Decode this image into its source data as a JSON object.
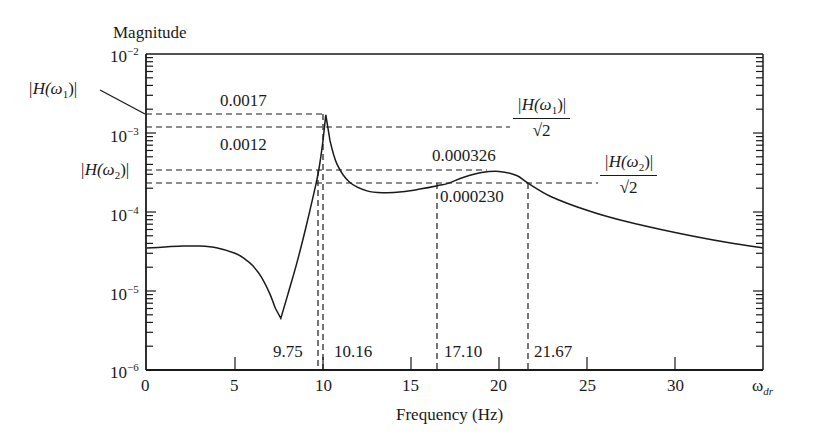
{
  "chart_data": {
    "type": "line",
    "title": "",
    "ylabel": "Magnitude",
    "xlabel": "Frequency (Hz)",
    "x_end_label": "ω_dr",
    "yscale": "log",
    "ylim": [
      1e-06,
      0.01
    ],
    "xlim": [
      0,
      35
    ],
    "grid": false,
    "x_ticks": [
      0,
      5,
      10,
      15,
      20,
      25,
      30
    ],
    "x_tick_labels": [
      "0",
      "5",
      "10",
      "15",
      "20",
      "25",
      "30"
    ],
    "y_tick_labels": [
      "10^-2",
      "10^-3",
      "10^-4",
      "10^-5",
      "10^-6"
    ],
    "series": [
      {
        "name": "|H(ω)|",
        "x": [
          0,
          1,
          2,
          3,
          4,
          5,
          5.5,
          6,
          6.5,
          7,
          7.3,
          7.6,
          8,
          8.5,
          9,
          9.5,
          9.75,
          10,
          10.16,
          10.4,
          10.8,
          11.5,
          12.5,
          13.5,
          14.5,
          15.5,
          16.5,
          17.1,
          18,
          19,
          20,
          21,
          21.67,
          23,
          25,
          27,
          30,
          33,
          35
        ],
        "y": [
          3.5e-05,
          3.6e-05,
          3.7e-05,
          3.7e-05,
          3.5e-05,
          3e-05,
          2.6e-05,
          2.1e-05,
          1.5e-05,
          9e-06,
          6e-06,
          4.5e-06,
          9e-06,
          2.2e-05,
          6e-05,
          0.00018,
          0.00033,
          0.0008,
          0.0017,
          0.0008,
          0.0004,
          0.00024,
          0.000185,
          0.000175,
          0.00018,
          0.000195,
          0.000215,
          0.00023,
          0.000275,
          0.000315,
          0.000326,
          0.00029,
          0.00023,
          0.000155,
          0.000105,
          7.8e-05,
          5.5e-05,
          4.1e-05,
          3.5e-05
        ]
      }
    ],
    "annotations": {
      "hlines": [
        {
          "value": 0.0017,
          "label": "0.0017",
          "side_label": "|H(ω1)|"
        },
        {
          "value": 0.0012,
          "label": "0.0012",
          "end_label_num": "|H(ω1)|",
          "end_label_den": "√2"
        },
        {
          "value": 0.000326,
          "label": "0.000326",
          "side_label": "|H(ω2)|"
        },
        {
          "value": 0.00023,
          "label": "0.000230",
          "end_label_num": "|H(ω2)|",
          "end_label_den": "√2"
        }
      ],
      "vlines": [
        {
          "x": 9.75,
          "label": "9.75"
        },
        {
          "x": 10.16,
          "label": "10.16"
        },
        {
          "x": 17.1,
          "label": "17.10"
        },
        {
          "x": 21.67,
          "label": "21.67"
        }
      ]
    }
  },
  "labels": {
    "ylabel": "Magnitude",
    "xlabel": "Frequency (Hz)",
    "xend_main": "ω",
    "xend_sub": "dr",
    "ytick_base": "10",
    "ytick_exps": [
      "−2",
      "−3",
      "−4",
      "−5",
      "−6"
    ],
    "xticks": [
      "0",
      "5",
      "10",
      "15",
      "20",
      "25",
      "30"
    ],
    "h1_side": "|H(ω",
    "h1_side_sub": "1",
    "h1_side_end": ")|",
    "h2_side": "|H(ω",
    "h2_side_sub": "2",
    "h2_side_end": ")|",
    "val_0017": "0.0017",
    "val_0012": "0.0012",
    "val_000326": "0.000326",
    "val_000230": "0.000230",
    "v_975": "9.75",
    "v_1016": "10.16",
    "v_1710": "17.10",
    "v_2167": "21.67",
    "frac1_num": "|H(ω",
    "frac1_sub": "1",
    "frac1_end": ")|",
    "frac2_num": "|H(ω",
    "frac2_sub": "2",
    "frac2_end": ")|",
    "frac_den": "√2"
  }
}
